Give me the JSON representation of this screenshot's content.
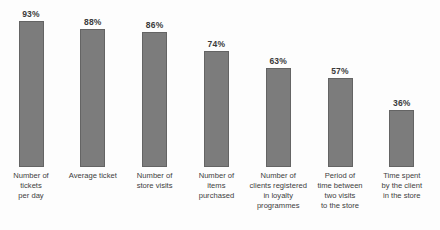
{
  "chart_data": {
    "type": "bar",
    "title": "",
    "xlabel": "",
    "ylabel": "",
    "ylim": [
      0,
      100
    ],
    "unit": "%",
    "grid": false,
    "legend": false,
    "bar_color": "#7c7c7c",
    "bar_border_color": "#646464",
    "text_color": "#404040",
    "categories": [
      "Number of tickets per day",
      "Average ticket",
      "Number of store visits",
      "Number of items purchased",
      "Number of clients registered in loyalty programmes",
      "Period of time between two visits to the store",
      "Time spent by the client in the store"
    ],
    "categories_wrapped": [
      [
        "Number of",
        "tickets",
        "per day"
      ],
      [
        "Average ticket"
      ],
      [
        "Number of",
        "store visits"
      ],
      [
        "Number of",
        "items",
        "purchased"
      ],
      [
        "Number of",
        "clients registered",
        "in loyalty",
        "programmes"
      ],
      [
        "Period of",
        "time between",
        "two visits",
        "to the store"
      ],
      [
        "Time spent",
        "by the client",
        "in the store"
      ]
    ],
    "values": [
      93,
      88,
      86,
      74,
      63,
      57,
      36
    ],
    "value_labels": [
      "93%",
      "88%",
      "86%",
      "74%",
      "63%",
      "57%",
      "36%"
    ]
  }
}
